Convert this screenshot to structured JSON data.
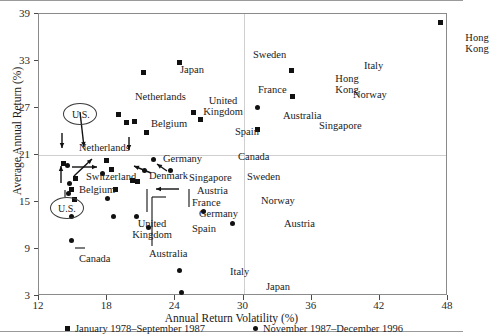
{
  "chart_data": {
    "type": "scatter",
    "title": "",
    "xlabel": "Annual Return Volatility (%)",
    "ylabel": "Average Annual Return (%)",
    "xlim": [
      12,
      48
    ],
    "ylim": [
      3,
      39
    ],
    "xticks": [
      12,
      18,
      24,
      30,
      36,
      42,
      48
    ],
    "yticks": [
      3,
      9,
      15,
      21,
      27,
      33,
      39
    ],
    "grid": "sparse",
    "gridlines": {
      "x": [
        30
      ],
      "y": [
        21
      ]
    },
    "legend_position": "bottom",
    "series": [
      {
        "name": "January 1978–September 1987",
        "marker": "square",
        "points": [
          {
            "label": "Netherlands",
            "x": 14.2,
            "y": 19.9,
            "lx": 40,
            "ly": 128,
            "lw": 2
          },
          {
            "label": "Switzerland",
            "x": 14.9,
            "y": 16.6,
            "lx": 47,
            "ly": 158,
            "lw": 1
          },
          {
            "label": "Belgium",
            "x": 15.1,
            "y": 15.3,
            "lx": 40,
            "ly": 171,
            "lw": 1
          },
          {
            "label": "U.S.",
            "x": 15.2,
            "y": 18.0,
            "lx": 0,
            "ly": 0,
            "lw": 0
          },
          {
            "label": "Germany",
            "x": 17.9,
            "y": 20.3,
            "lx": 124,
            "ly": 140,
            "lw": 1
          },
          {
            "label": "Denmark",
            "x": 18.4,
            "y": 19.1,
            "lx": 110,
            "ly": 157,
            "lw": 1
          },
          {
            "label": "France",
            "x": 20.7,
            "y": 17.6,
            "lx": 153,
            "ly": 184,
            "lw": 1
          },
          {
            "label": "Australia",
            "x": 18.7,
            "y": 16.6,
            "lx": 110,
            "ly": 235,
            "lw": 1
          },
          {
            "label": "Austria",
            "x": 20.2,
            "y": 17.7,
            "lx": 158,
            "ly": 172,
            "lw": 1
          },
          {
            "label": "Netherlands",
            "x": 19.0,
            "y": 26.2,
            "lx": 96,
            "ly": 78,
            "lw": 1
          },
          {
            "label": "Belgium",
            "x": 19.7,
            "y": 25.2,
            "lx": 112,
            "ly": 105,
            "lw": 1
          },
          {
            "label": "United Kingdom",
            "x": 20.4,
            "y": 25.3,
            "lx": 161,
            "ly": 81,
            "lw": 2
          },
          {
            "label": "Japan",
            "x": 21.2,
            "y": 31.5,
            "lx": 141,
            "ly": 51,
            "lw": 1
          },
          {
            "label": "Spain",
            "x": 21.5,
            "y": 23.9,
            "lx": 196,
            "ly": 113,
            "lw": 1
          },
          {
            "label": "Sweden",
            "x": 24.4,
            "y": 32.8,
            "lx": 214,
            "ly": 36,
            "lw": 1
          },
          {
            "label": "France",
            "x": 25.6,
            "y": 26.4,
            "lx": 219,
            "ly": 71,
            "lw": 1
          },
          {
            "label": "Australia",
            "x": 26.2,
            "y": 25.5,
            "lx": 244,
            "ly": 97,
            "lw": 1
          },
          {
            "label": "Singapore",
            "x": 31.2,
            "y": 24.3,
            "lx": 280,
            "ly": 107,
            "lw": 1
          },
          {
            "label": "Italy",
            "x": 34.2,
            "y": 31.8,
            "lx": 325,
            "ly": 47,
            "lw": 1
          },
          {
            "label": "Norway",
            "x": 34.3,
            "y": 28.5,
            "lx": 314,
            "ly": 76,
            "lw": 1
          },
          {
            "label": "Hong Kong",
            "x": 47.3,
            "y": 37.9,
            "lx": 415,
            "ly": 18,
            "lw": 2
          }
        ]
      },
      {
        "name": "November 1987–December 1996",
        "marker": "circle",
        "points": [
          {
            "label": "Netherlands",
            "x": 14.5,
            "y": 19.6,
            "lx": 0,
            "ly": 0,
            "lw": 0
          },
          {
            "label": "Switzerland",
            "x": 14.7,
            "y": 17.4,
            "lx": 0,
            "ly": 0,
            "lw": 0
          },
          {
            "label": "Belgium",
            "x": 14.6,
            "y": 16.1,
            "lx": 0,
            "ly": 0,
            "lw": 0
          },
          {
            "label": "U.S.",
            "x": 14.9,
            "y": 13.1,
            "lx": 0,
            "ly": 0,
            "lw": 0
          },
          {
            "label": "Canada",
            "x": 14.9,
            "y": 10.1,
            "lx": 40,
            "ly": 240,
            "lw": 1
          },
          {
            "label": "United Kingdom",
            "x": 18.0,
            "y": 15.5,
            "lx": 90,
            "ly": 204,
            "lw": 2
          },
          {
            "label": "Denmark",
            "x": 17.6,
            "y": 18.7,
            "lx": 0,
            "ly": 0,
            "lw": 0
          },
          {
            "label": "Australia",
            "x": 18.6,
            "y": 13.2,
            "lx": 0,
            "ly": 0,
            "lw": 0
          },
          {
            "label": "Germany",
            "x": 20.6,
            "y": 13.1,
            "lx": 160,
            "ly": 195,
            "lw": 1
          },
          {
            "label": "Spain",
            "x": 21.6,
            "y": 11.7,
            "lx": 153,
            "ly": 210,
            "lw": 1
          },
          {
            "label": "Singapore",
            "x": 21.3,
            "y": 19.0,
            "lx": 150,
            "ly": 159,
            "lw": 1
          },
          {
            "label": "Canada",
            "x": 22.1,
            "y": 20.4,
            "lx": 199,
            "ly": 138,
            "lw": 1
          },
          {
            "label": "Sweden",
            "x": 23.6,
            "y": 19.0,
            "lx": 208,
            "ly": 158,
            "lw": 1
          },
          {
            "label": "Norway",
            "x": 26.5,
            "y": 13.8,
            "lx": 222,
            "ly": 182,
            "lw": 1
          },
          {
            "label": "Austria",
            "x": 29.0,
            "y": 12.2,
            "lx": 245,
            "ly": 205,
            "lw": 1
          },
          {
            "label": "Italy",
            "x": 24.4,
            "y": 6.2,
            "lx": 191,
            "ly": 253,
            "lw": 1
          },
          {
            "label": "Japan",
            "x": 24.5,
            "y": 3.5,
            "lx": 227,
            "ly": 268,
            "lw": 1
          },
          {
            "label": "Hong Kong",
            "x": 31.2,
            "y": 27.1,
            "lx": 285,
            "ly": 59,
            "lw": 2
          }
        ]
      }
    ],
    "annotations": [
      {
        "label": "U.S.",
        "kind": "ellipse-callout",
        "note": "upper U.S. square marker circled"
      },
      {
        "label": "U.S.",
        "kind": "ellipse-callout",
        "note": "lower U.S. circle marker circled"
      }
    ]
  },
  "axis": {
    "y_label": "Average Annual Return (%)",
    "x_label": "Annual Return Volatility (%)",
    "y_ticks": [
      "39",
      "33",
      "27",
      "21",
      "15",
      "9",
      "3"
    ],
    "x_ticks": [
      "12",
      "18",
      "24",
      "30",
      "36",
      "42",
      "48"
    ]
  },
  "legend": {
    "items": [
      {
        "label": "January 1978–September 1987",
        "marker": "square"
      },
      {
        "label": "November 1987–December 1996",
        "marker": "circle"
      }
    ]
  },
  "callouts": {
    "us_upper": "U.S.",
    "us_lower": "U.S."
  },
  "colors": {
    "marker": "#111111",
    "frame": "#8a8a8a",
    "grid": "#cfcfcf",
    "text": "#1a1a1a",
    "background": "#ffffff"
  }
}
